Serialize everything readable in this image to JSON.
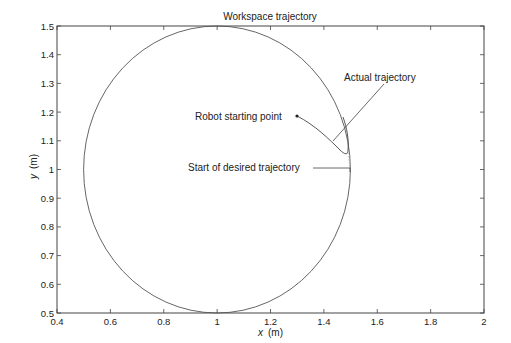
{
  "chart_data": {
    "type": "line",
    "title": "Workspace trajectory",
    "xlabel": "x",
    "xlabel_unit": "(m)",
    "ylabel": "y",
    "ylabel_unit": "(m)",
    "xlim": [
      0.4,
      2
    ],
    "ylim": [
      0.5,
      1.5
    ],
    "xticks": [
      "0.4",
      "0.6",
      "0.8",
      "1",
      "1.2",
      "1.4",
      "1.6",
      "1.8",
      "2"
    ],
    "yticks": [
      "0.5",
      "0.6",
      "0.7",
      "0.8",
      "0.9",
      "1",
      "1.1",
      "1.2",
      "1.3",
      "1.4",
      "1.5"
    ],
    "grid": false,
    "series": [
      {
        "name": "Desired trajectory",
        "shape": "circle",
        "center": [
          1.0,
          1.0
        ],
        "radius": 0.5,
        "start": [
          1.5,
          1.0
        ],
        "style": "solid"
      },
      {
        "name": "Actual trajectory",
        "start": [
          1.29,
          1.185
        ],
        "points": [
          [
            1.29,
            1.185
          ],
          [
            1.36,
            1.14
          ],
          [
            1.42,
            1.09
          ],
          [
            1.47,
            1.06
          ],
          [
            1.485,
            1.08
          ],
          [
            1.48,
            1.13
          ],
          [
            1.46,
            1.18
          ]
        ],
        "style": "solid"
      },
      {
        "name": "Transition",
        "points": [
          [
            1.49,
            1.06
          ],
          [
            1.5,
            1.0
          ]
        ],
        "style": "dotted"
      }
    ],
    "annotations": [
      {
        "text": "Actual trajectory",
        "x": 1.52,
        "y": 1.265
      },
      {
        "text": "Robot starting point",
        "x": 1.17,
        "y": 1.185
      },
      {
        "text": "Start of desired trajectory",
        "x": 1.14,
        "y": 1.0
      }
    ]
  }
}
